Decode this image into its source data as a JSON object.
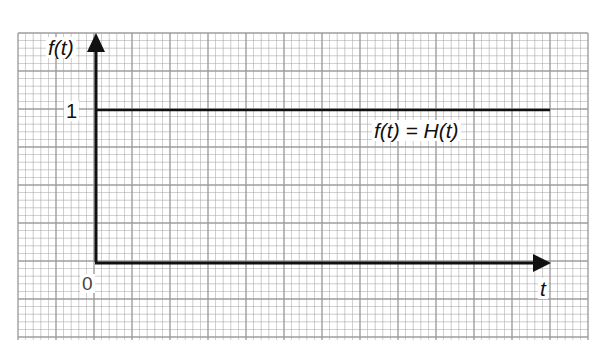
{
  "chart_data": {
    "type": "line",
    "title": "",
    "function_label": "f(t) = H(t)",
    "xlabel": "t",
    "ylabel": "f(t)",
    "x_ticks": [
      "0"
    ],
    "y_ticks": [
      "1"
    ],
    "series": [
      {
        "name": "f(t) = H(t)",
        "x": [
          0,
          1
        ],
        "y": [
          1,
          1
        ],
        "description": "Heaviside unit step: f(t)=1 for t>=0"
      }
    ],
    "grid": true,
    "grid_style": "graph paper, minor and major lines",
    "ylim": [
      0,
      1.6
    ],
    "xlim": [
      0,
      1
    ]
  },
  "labels": {
    "y_axis": "f(t)",
    "x_axis": "t",
    "origin": "0",
    "one": "1",
    "function": "f(t) = H(t)"
  },
  "colors": {
    "grid": "#9a9a9a",
    "axis": "#111111",
    "background": "#ffffff"
  }
}
